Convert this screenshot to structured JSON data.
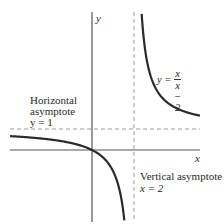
{
  "figure": {
    "axes": {
      "x_label": "x",
      "y_label": "y",
      "origin_px": [
        92,
        150
      ],
      "scale_px_per_unit": 21
    },
    "function": {
      "label_lhs": "y =",
      "numerator": "x",
      "denominator": "x − 2",
      "expression": "y = x/(x - 2)"
    },
    "horizontal_asymptote": {
      "title_line1": "Horizontal",
      "title_line2": "asymptote",
      "equation": "y = 1",
      "value": 1
    },
    "vertical_asymptote": {
      "title": "Vertical asymptote",
      "equation": "x = 2",
      "value": 2
    },
    "colors": {
      "curve": "#2b2b2b",
      "axis": "#555555",
      "asymptote": "#999999",
      "background": "#ffffff"
    }
  }
}
